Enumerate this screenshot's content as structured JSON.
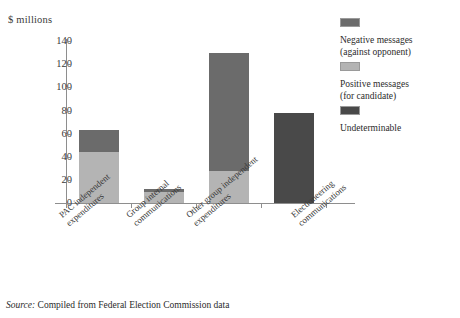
{
  "axis_unit_label": "$ millions",
  "source": {
    "label": "Source:",
    "text": "Compiled from Federal Election Commission data"
  },
  "legend": {
    "items": [
      {
        "name": "negative",
        "line1": "Negative messages",
        "line2": "(against opponent)",
        "color": "#6b6b6b"
      },
      {
        "name": "positive",
        "line1": "Positive messages",
        "line2": "(for candidate)",
        "color": "#b4b4b4"
      },
      {
        "name": "undeterminable",
        "line1": "Undeterminable",
        "line2": "",
        "color": "#494949"
      }
    ]
  },
  "chart_data": {
    "type": "bar",
    "subtype": "stacked",
    "title": "",
    "xlabel": "",
    "ylabel": "$ millions",
    "ylim": [
      0,
      140
    ],
    "yticks": [
      0,
      20,
      40,
      60,
      80,
      100,
      120,
      140
    ],
    "ytick_labels": [
      "0",
      "20",
      "40",
      "60",
      "80",
      "100",
      "120",
      "140"
    ],
    "grid": false,
    "legend_position": "top-right",
    "categories": [
      "PAC independent expenditures",
      "Group internal communications",
      "Other group independent expenditures",
      "Electioneering communications"
    ],
    "category_lines": [
      [
        "PAC independent",
        "expenditures"
      ],
      [
        "Group internal",
        "communications"
      ],
      [
        "Other group independent",
        "expenditures"
      ],
      [
        "Electioneering",
        "communications"
      ]
    ],
    "series": [
      {
        "name": "Positive messages (for candidate)",
        "color": "#b4b4b4",
        "values": [
          44,
          9.5,
          28,
          0
        ]
      },
      {
        "name": "Negative messages (against opponent)",
        "color": "#6b6b6b",
        "values": [
          19,
          2.5,
          102,
          0
        ]
      },
      {
        "name": "Undeterminable",
        "color": "#494949",
        "values": [
          0,
          0,
          0,
          78
        ]
      }
    ],
    "totals": [
      63,
      12,
      130,
      78
    ]
  }
}
